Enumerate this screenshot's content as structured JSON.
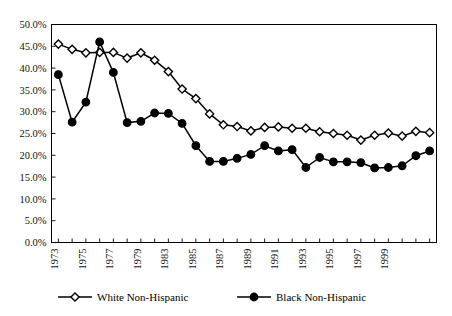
{
  "chart_data": {
    "type": "line",
    "title": "",
    "subtitle": "",
    "xlabel": "",
    "ylabel": "",
    "ylim": [
      0,
      50
    ],
    "ytick_labels": [
      "0.0%",
      "5.0%",
      "10.0%",
      "15.0%",
      "20.0%",
      "25.0%",
      "30.0%",
      "35.0%",
      "40.0%",
      "45.0%",
      "50.0%"
    ],
    "ytick_values": [
      0,
      5,
      10,
      15,
      20,
      25,
      30,
      35,
      40,
      45,
      50
    ],
    "grid": "horizontal",
    "legend_position": "bottom",
    "x": [
      1973,
      1974,
      1975,
      1976,
      1977,
      1978,
      1979,
      1980,
      1981,
      1982,
      1983,
      1984,
      1985,
      1986,
      1987,
      1988,
      1989,
      1990,
      1991,
      1992,
      1993,
      1994,
      1995,
      1996,
      1997,
      1998,
      1999,
      2000
    ],
    "xtick_labels": [
      "1973",
      "",
      "1975",
      "",
      "1977",
      "",
      "1979",
      "",
      "1983",
      "",
      "1985",
      "",
      "1987",
      "",
      "1989",
      "",
      "1991",
      "",
      "1993",
      "",
      "1995",
      "",
      "1997",
      "",
      "1999",
      "",
      "",
      ""
    ],
    "xtick_labels_shown": [
      "1973",
      "1975",
      "1977",
      "1979",
      "1983",
      "1985",
      "1987",
      "1989",
      "1991",
      "1993",
      "1995",
      "1997",
      "1999"
    ],
    "series": [
      {
        "name": "White Non-Hispanic",
        "marker": "open-diamond",
        "color": "#000000",
        "values": [
          45.5,
          44.3,
          43.5,
          43.6,
          43.6,
          42.3,
          43.5,
          41.8,
          39.2,
          35.2,
          33.0,
          29.5,
          27.0,
          26.6,
          25.6,
          26.4,
          26.5,
          26.2,
          26.2,
          25.4,
          25.0,
          24.6,
          23.5,
          24.6,
          25.1,
          24.4,
          25.5,
          25.2
        ]
      },
      {
        "name": "Black Non-Hispanic",
        "marker": "filled-circle",
        "color": "#000000",
        "values": [
          38.5,
          27.6,
          32.2,
          46.0,
          39.0,
          27.5,
          27.8,
          29.7,
          29.6,
          27.3,
          22.2,
          18.6,
          18.6,
          19.3,
          20.2,
          22.2,
          21.0,
          21.3,
          17.2,
          19.5,
          18.5,
          18.5,
          18.3,
          17.1,
          17.2,
          17.6,
          19.9,
          21.0
        ]
      }
    ]
  },
  "legend": {
    "items": [
      {
        "label": "White Non-Hispanic",
        "marker": "open-diamond"
      },
      {
        "label": "Black Non-Hispanic",
        "marker": "filled-circle"
      }
    ]
  }
}
